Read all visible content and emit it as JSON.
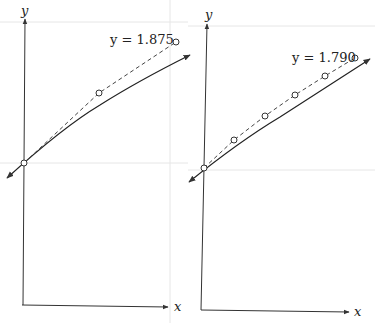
{
  "panels": [
    {
      "id": "left",
      "axis_labels": {
        "x": "x",
        "y": "y"
      },
      "label": "y = 1.875",
      "label_pos": [
        110,
        44
      ],
      "y_axis": {
        "x1": 23,
        "y1": 305,
        "x2": 25,
        "y2": 19,
        "label_pos": [
          21,
          15
        ]
      },
      "x_axis": {
        "x1": 22,
        "y1": 305,
        "x2": 168,
        "y2": 307,
        "label_pos": [
          174,
          311
        ]
      },
      "curve": "M7,178 C40,148 70,123 100,105 C130,86 160,70 190,55",
      "curve_arrow_end": [
        190,
        55
      ],
      "curve_arrow_start": [
        7,
        178
      ],
      "dashed": [
        [
          24,
          163
        ],
        [
          99,
          93
        ],
        [
          176,
          42
        ]
      ],
      "points": [
        [
          24,
          163
        ],
        [
          99,
          93
        ],
        [
          176,
          42
        ]
      ],
      "grid_h": [
        22,
        163
      ],
      "grid_v": [
        170
      ]
    },
    {
      "id": "right",
      "axis_labels": {
        "x": "x",
        "y": "y"
      },
      "label": "y = 1.790",
      "label_pos": [
        292,
        62
      ],
      "y_axis": {
        "x1": 201,
        "y1": 310,
        "x2": 207,
        "y2": 24,
        "label_pos": [
          205,
          19
        ]
      },
      "x_axis": {
        "x1": 201,
        "y1": 310,
        "x2": 349,
        "y2": 312,
        "label_pos": [
          354,
          316
        ]
      },
      "curve": "M189,182 C220,157 250,135 280,117 C310,98 340,78 370,59",
      "curve_arrow_end": [
        370,
        59
      ],
      "curve_arrow_start": [
        189,
        182
      ],
      "dashed": [
        [
          204,
          168
        ],
        [
          234,
          140
        ],
        [
          265,
          116
        ],
        [
          295,
          95
        ],
        [
          325,
          76
        ],
        [
          355,
          58
        ]
      ],
      "points": [
        [
          204,
          168
        ],
        [
          234,
          140
        ],
        [
          265,
          116
        ],
        [
          295,
          95
        ],
        [
          325,
          76
        ],
        [
          355,
          58
        ]
      ],
      "grid_h": [
        26,
        170
      ],
      "grid_v": []
    }
  ]
}
